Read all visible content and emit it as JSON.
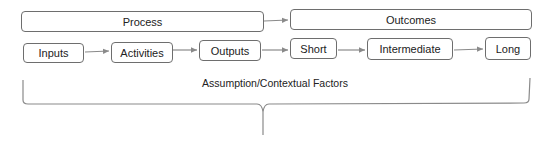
{
  "diagram": {
    "colors": {
      "border": "#6e6e6e",
      "arrow": "#8a8a8a",
      "text": "#222222",
      "background": "#ffffff"
    },
    "groups": [
      {
        "id": "process",
        "label": "Process"
      },
      {
        "id": "outcomes",
        "label": "Outcomes"
      }
    ],
    "steps": [
      {
        "id": "inputs",
        "label": "Inputs",
        "group": "process"
      },
      {
        "id": "activities",
        "label": "Activities",
        "group": "process"
      },
      {
        "id": "outputs",
        "label": "Outputs",
        "group": "process"
      },
      {
        "id": "short",
        "label": "Short",
        "group": "outcomes"
      },
      {
        "id": "intermediate",
        "label": "Intermediate",
        "group": "outcomes"
      },
      {
        "id": "long",
        "label": "Long",
        "group": "outcomes"
      }
    ],
    "edges": [
      {
        "from": "process",
        "to": "outcomes"
      },
      {
        "from": "inputs",
        "to": "activities"
      },
      {
        "from": "activities",
        "to": "outputs"
      },
      {
        "from": "outputs",
        "to": "short"
      },
      {
        "from": "short",
        "to": "intermediate"
      },
      {
        "from": "intermediate",
        "to": "long"
      }
    ],
    "brace_label": "Assumption/Contextual Factors"
  }
}
